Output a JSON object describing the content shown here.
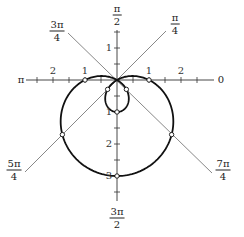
{
  "chart_data": {
    "type": "line",
    "subtype": "polar",
    "title": "",
    "equation": "r = 1 - 2 sin(theta)",
    "curve": {
      "a": 1,
      "b": -2,
      "function": "sin",
      "theta_range": [
        0,
        6.283185307
      ]
    },
    "radial_ticks": [
      0.5,
      1,
      1.5,
      2,
      2.5,
      3,
      3.5
    ],
    "radial_tick_labels": {
      "positive_x": [
        "1",
        "2"
      ],
      "negative_x": [
        "1",
        "2"
      ],
      "positive_y": [
        "1"
      ],
      "negative_y": [
        "1",
        "2",
        "3"
      ]
    },
    "angle_labels": [
      {
        "angle": "0",
        "num": "0",
        "den": ""
      },
      {
        "angle": "pi/4",
        "num": "π",
        "den": "4"
      },
      {
        "angle": "pi/2",
        "num": "π",
        "den": "2"
      },
      {
        "angle": "3pi/4",
        "num": "3π",
        "den": "4"
      },
      {
        "angle": "pi",
        "num": "π",
        "den": ""
      },
      {
        "angle": "5pi/4",
        "num": "5π",
        "den": "4"
      },
      {
        "angle": "3pi/2",
        "num": "3π",
        "den": "2"
      },
      {
        "angle": "7pi/4",
        "num": "7π",
        "den": "4"
      }
    ],
    "marked_points": [
      {
        "theta": "0",
        "r": 1,
        "x": 1,
        "y": 0
      },
      {
        "theta": "pi/4",
        "r": -0.414,
        "x": -0.293,
        "y": -0.293
      },
      {
        "theta": "pi/2",
        "r": -1,
        "x": 0,
        "y": -1
      },
      {
        "theta": "3pi/4",
        "r": -0.414,
        "x": 0.293,
        "y": -0.293
      },
      {
        "theta": "pi",
        "r": 1,
        "x": -1,
        "y": 0
      },
      {
        "theta": "5pi/4",
        "r": 2.414,
        "x": -1.707,
        "y": -1.707
      },
      {
        "theta": "3pi/2",
        "r": 3,
        "x": 0,
        "y": -3
      },
      {
        "theta": "7pi/4",
        "r": 2.414,
        "x": 1.707,
        "y": -1.707
      },
      {
        "theta": "pi/6",
        "r": 0,
        "x": 0,
        "y": 0
      }
    ],
    "xlim": [
      -3.0,
      3.1
    ],
    "ylim": [
      -3.8,
      1.6
    ],
    "grid": false,
    "legend": null,
    "colors": {
      "curve": "#111111",
      "axes": "#333333",
      "rays": "#555555",
      "point_fill": "#ffffff"
    }
  }
}
